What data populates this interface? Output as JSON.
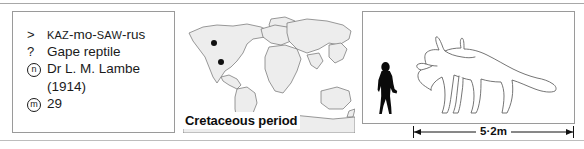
{
  "info_panel": {
    "rows": [
      {
        "marker": ">",
        "marker_type": "glyph",
        "type": "pronunciation",
        "parts": [
          {
            "text": "KAZ",
            "style": "smallcaps"
          },
          {
            "text": "-",
            "style": "lower"
          },
          {
            "text": "mo",
            "style": "lower"
          },
          {
            "text": "-",
            "style": "lower"
          },
          {
            "text": "SAW",
            "style": "smallcaps"
          },
          {
            "text": "-",
            "style": "lower"
          },
          {
            "text": "rus",
            "style": "lower"
          }
        ],
        "plain": "KAZ-mo-SAW-rus"
      },
      {
        "marker": "?",
        "marker_type": "glyph",
        "type": "meaning",
        "plain": "Gape reptile"
      },
      {
        "marker": "n",
        "marker_type": "circled",
        "type": "named_by",
        "plain": "Dr L. M. Lambe"
      },
      {
        "marker": "",
        "marker_type": "none",
        "type": "named_year",
        "plain": "(1914)"
      },
      {
        "marker": "m",
        "marker_type": "circled",
        "type": "museum_number",
        "plain": "29"
      }
    ]
  },
  "map_panel": {
    "period_label": "Cretaceous period",
    "find_sites": [
      {
        "x": 31,
        "y": 32
      },
      {
        "x": 38,
        "y": 51
      }
    ],
    "land_fill": "#ededed",
    "outline_color": "#6f6f6f"
  },
  "size_panel": {
    "human_label": "human-silhouette",
    "dinosaur_label": "ceratopsian-dinosaur-outline"
  },
  "scale": {
    "length_label": "5·2m"
  }
}
